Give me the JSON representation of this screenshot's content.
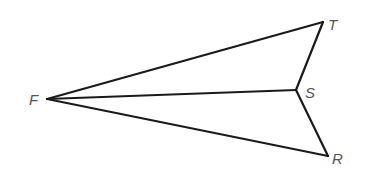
{
  "diagram": {
    "type": "geometry-figure",
    "stroke_color": "#1a1a1a",
    "label_color": "#555555",
    "points": {
      "F": {
        "label": "F",
        "x": 47,
        "y": 99,
        "label_x": 29,
        "label_y": 105
      },
      "T": {
        "label": "T",
        "x": 323,
        "y": 22,
        "label_x": 328,
        "label_y": 30
      },
      "S": {
        "label": "S",
        "x": 296,
        "y": 90,
        "label_x": 305,
        "label_y": 98
      },
      "R": {
        "label": "R",
        "x": 328,
        "y": 156,
        "label_x": 332,
        "label_y": 164
      }
    },
    "segments": [
      {
        "from": "F",
        "to": "T"
      },
      {
        "from": "F",
        "to": "S"
      },
      {
        "from": "F",
        "to": "R"
      },
      {
        "from": "T",
        "to": "S"
      },
      {
        "from": "S",
        "to": "R"
      }
    ]
  }
}
